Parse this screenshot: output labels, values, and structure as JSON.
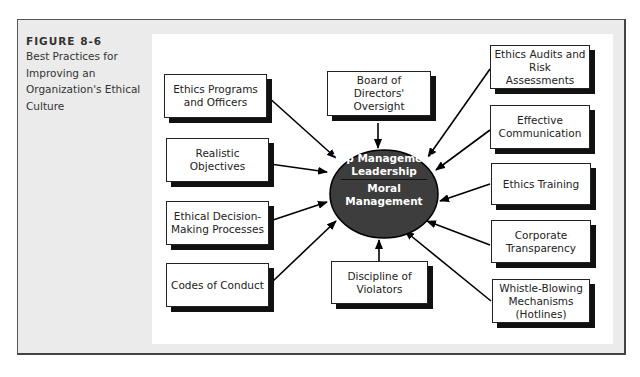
{
  "figure": {
    "number": "FIGURE 8-6",
    "title": "Best Practices for Improving an Organization's Ethical Culture"
  },
  "center": {
    "top_label": "Top Management Leadership",
    "bottom_label": "Moral Management",
    "fill_color": "#3d3d3d"
  },
  "practices": {
    "left": [
      {
        "label": "Ethics Programs and Officers"
      },
      {
        "label": "Realistic Objectives"
      },
      {
        "label": "Ethical Decision-Making Processes"
      },
      {
        "label": "Codes of Conduct"
      }
    ],
    "top": {
      "label": "Board of Directors' Oversight"
    },
    "bottom": {
      "label": "Discipline of Violators"
    },
    "right": [
      {
        "label": "Ethics Audits and Risk Assessments"
      },
      {
        "label": "Effective Communication"
      },
      {
        "label": "Ethics Training"
      },
      {
        "label": "Corporate Transparency"
      },
      {
        "label": "Whistle-Blowing Mechanisms (Hotlines)"
      }
    ]
  },
  "colors": {
    "panel_background": "#ebebeb",
    "box_shadow": "#111111",
    "arrow": "#000000"
  }
}
